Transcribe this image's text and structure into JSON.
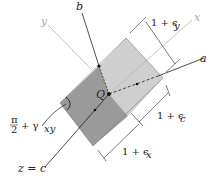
{
  "figure": {
    "type": "strain element diagram",
    "axes": {
      "x": "x",
      "y": "y",
      "a": "a",
      "b": "b",
      "c": "z = c"
    },
    "point_label": "Q",
    "dimensions": {
      "top": "1 + ϵ",
      "top_sub": "y",
      "right": "1 + ϵ",
      "right_sub": "c",
      "bottom": "1 + ϵ",
      "bottom_sub": "x"
    },
    "angle": {
      "numerator": "π",
      "denominator": "2",
      "rest": "+ γ",
      "sub": "xy"
    },
    "colors": {
      "dark_face": "#9a9a9a",
      "light_face": "#cfcfcf",
      "light_axis": "#b5b5b5",
      "ink": "#222222"
    }
  }
}
